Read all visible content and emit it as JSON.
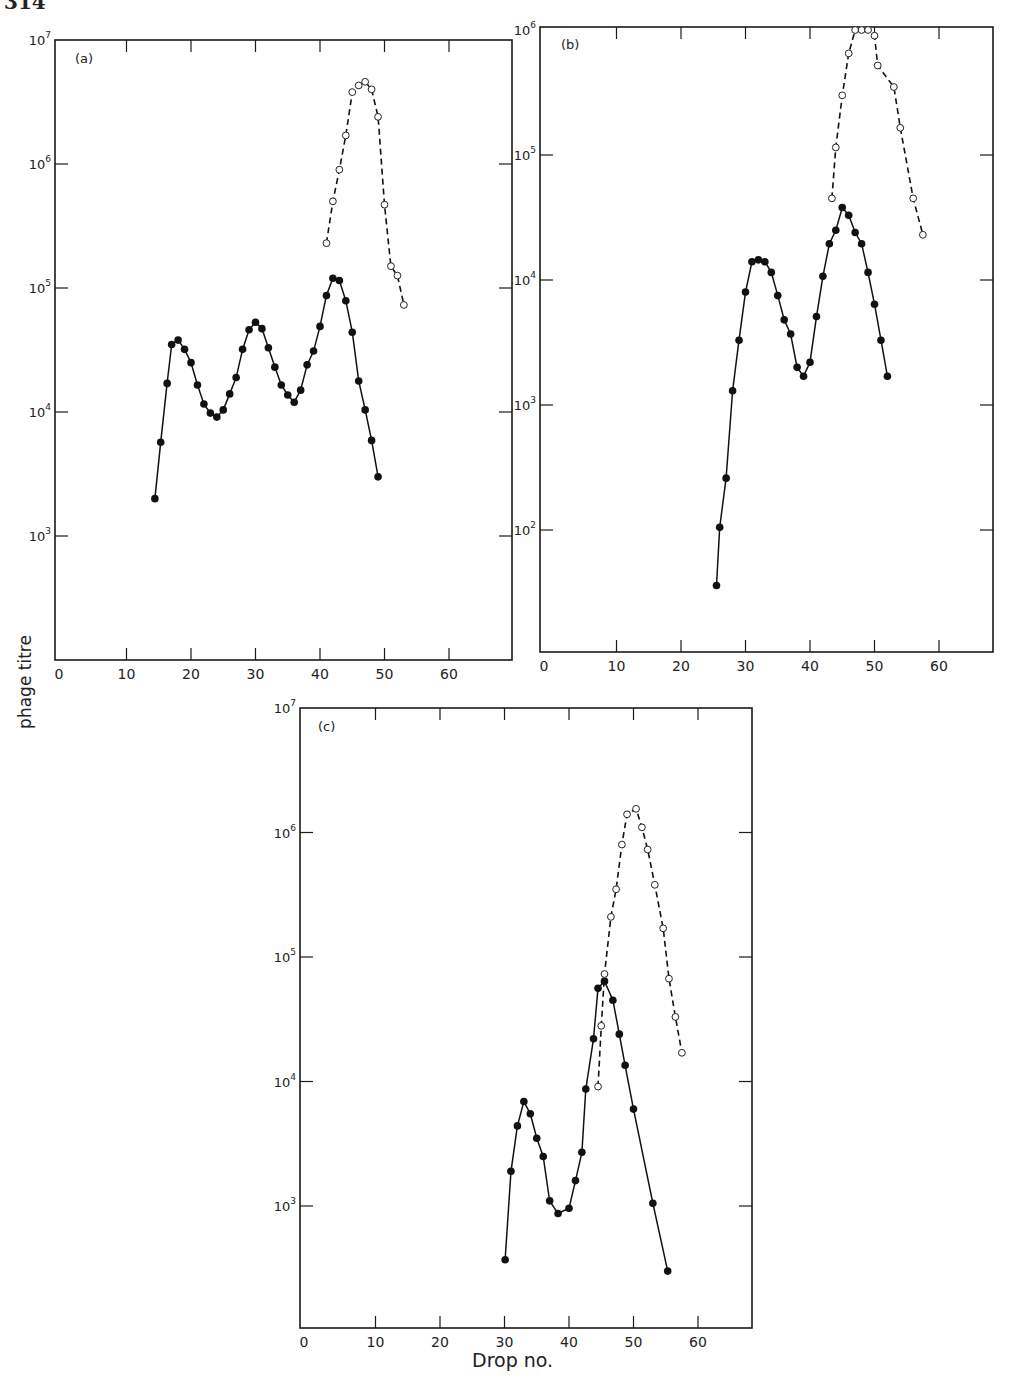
{
  "page": {
    "number_fragment": "314"
  },
  "figure": {
    "ylabel": "phage titre",
    "xlabel": "Drop no.",
    "series_legend": [
      {
        "name": "filled circles, solid line",
        "marker": "filled-circle",
        "line": "solid"
      },
      {
        "name": "open circles, dashed line",
        "marker": "open-circle",
        "line": "dashed"
      }
    ]
  },
  "chart_data": [
    {
      "type": "line",
      "panel": "(a)",
      "title": "(a)",
      "xlabel": "Drop no.",
      "ylabel": "phage titre",
      "yscale": "log",
      "xlim": [
        0,
        70
      ],
      "ylim": [
        100,
        10000000
      ],
      "x_ticks": [
        0,
        10,
        20,
        30,
        40,
        50,
        60
      ],
      "y_ticks": [
        "10^3",
        "10^4",
        "10^5",
        "10^6",
        "10^7"
      ],
      "grid": false,
      "series": [
        {
          "name": "filled",
          "marker": "filled-circle",
          "line": "solid",
          "x": [
            14.4,
            15.3,
            16.3,
            17,
            18,
            19,
            20,
            21,
            22,
            23,
            24,
            25,
            26,
            27,
            28,
            29,
            30,
            31,
            32,
            33,
            34,
            35,
            36,
            37,
            38,
            39,
            40,
            41,
            42,
            43,
            44,
            45,
            46,
            47,
            48,
            49
          ],
          "values": [
            2000,
            5700,
            17000,
            35000,
            38000,
            32000,
            25000,
            16500,
            11600,
            9800,
            9100,
            10400,
            14000,
            19000,
            32000,
            46000,
            53000,
            47000,
            33000,
            23000,
            16500,
            13700,
            12000,
            15000,
            24000,
            31000,
            49000,
            87000,
            120000,
            115000,
            79000,
            44000,
            17800,
            10400,
            5900,
            3000
          ]
        },
        {
          "name": "open",
          "marker": "open-circle",
          "line": "dashed",
          "x": [
            41,
            42,
            43,
            44,
            45,
            46,
            47,
            48,
            49,
            50,
            51,
            52,
            53
          ],
          "values": [
            230000,
            500000,
            900000,
            1700000,
            3800000,
            4300000,
            4600000,
            4000000,
            2400000,
            470000,
            150000,
            126000,
            73000
          ]
        }
      ]
    },
    {
      "type": "line",
      "panel": "(b)",
      "title": "(b)",
      "xlabel": "Drop no.",
      "ylabel": "phage titre",
      "yscale": "log",
      "xlim": [
        0,
        68
      ],
      "ylim": [
        10,
        1000000
      ],
      "x_ticks": [
        0,
        10,
        20,
        30,
        40,
        50,
        60
      ],
      "y_ticks": [
        "10^2",
        "10^3",
        "10^4",
        "10^5",
        "10^6"
      ],
      "grid": false,
      "series": [
        {
          "name": "filled",
          "marker": "filled-circle",
          "line": "solid",
          "x": [
            25.5,
            26,
            27,
            28,
            29,
            30,
            31,
            32,
            33,
            34,
            35,
            36,
            37,
            38,
            39,
            40,
            41,
            42,
            43,
            44,
            45,
            46,
            47,
            48,
            49,
            50,
            51,
            52
          ],
          "values": [
            36,
            105,
            260,
            1300,
            3300,
            8000,
            14000,
            14500,
            14000,
            11500,
            7500,
            4800,
            3700,
            2000,
            1700,
            2200,
            5100,
            10700,
            19500,
            25000,
            38000,
            33000,
            24000,
            19500,
            11500,
            6400,
            3300,
            1700
          ]
        },
        {
          "name": "open",
          "marker": "open-circle",
          "line": "dashed",
          "x": [
            43.4,
            44,
            45,
            46,
            47,
            48,
            49,
            50,
            50.5,
            53,
            54,
            56,
            57.5
          ],
          "values": [
            45000,
            115000,
            300000,
            650000,
            1000000,
            1000000,
            1000000,
            900000,
            520000,
            350000,
            165000,
            45000,
            23000
          ]
        }
      ]
    },
    {
      "type": "line",
      "panel": "(c)",
      "title": "(c)",
      "xlabel": "Drop no.",
      "ylabel": "phage titre",
      "yscale": "log",
      "xlim": [
        0,
        70
      ],
      "ylim": [
        100,
        10000000
      ],
      "x_ticks": [
        0,
        10,
        20,
        30,
        40,
        50,
        60
      ],
      "y_ticks": [
        "10^3",
        "10^4",
        "10^5",
        "10^6",
        "10^7"
      ],
      "grid": false,
      "series": [
        {
          "name": "filled",
          "marker": "filled-circle",
          "line": "solid",
          "x": [
            30.1,
            31,
            32,
            33,
            34,
            35,
            36,
            37,
            38.3,
            40,
            41,
            42,
            42.6,
            43.8,
            44.5,
            45.5,
            46.8,
            47.8,
            48.7,
            50,
            53,
            55.3
          ],
          "values": [
            370,
            1900,
            4400,
            6900,
            5500,
            3500,
            2500,
            1100,
            870,
            960,
            1600,
            2700,
            8700,
            22000,
            56000,
            64000,
            45000,
            24000,
            13500,
            6000,
            1050,
            300
          ]
        },
        {
          "name": "open",
          "marker": "open-circle",
          "line": "dashed",
          "x": [
            44.5,
            45,
            45.5,
            46.5,
            47.3,
            48.2,
            49,
            50.4,
            51.3,
            52.2,
            53.3,
            54.6,
            55.5,
            56.5,
            57.5
          ],
          "values": [
            9100,
            28000,
            73000,
            210000,
            350000,
            800000,
            1400000,
            1550000,
            1100000,
            730000,
            380000,
            170000,
            67000,
            33000,
            17000
          ]
        }
      ]
    }
  ]
}
